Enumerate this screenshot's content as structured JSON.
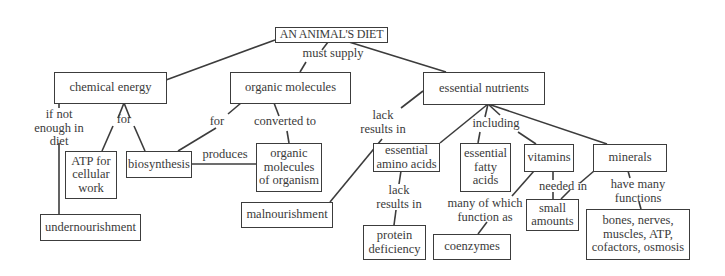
{
  "diagram": {
    "type": "concept-map",
    "title": "AN ANIMAL'S DIET",
    "nodes": {
      "root": "AN ANIMAL'S DIET",
      "chemical_energy": "chemical energy",
      "organic_molecules": "organic molecules",
      "essential_nutrients": "essential nutrients",
      "atp": "ATP for\ncellular\nwork",
      "biosynthesis": "biosynthesis",
      "organic_of_organism": "organic\nmolecules\nof organism",
      "undernourishment": "undernourishment",
      "malnourishment": "malnourishment",
      "amino_acids": "essential\namino acids",
      "fatty_acids": "essential\nfatty\nacids",
      "vitamins": "vitamins",
      "minerals": "minerals",
      "small_amounts": "small\namounts",
      "protein_deficiency": "protein\ndeficiency",
      "coenzymes": "coenzymes",
      "mineral_functions": "bones, nerves,\nmuscles, ATP,\ncofactors, osmosis"
    },
    "link_labels": {
      "must_supply": "must supply",
      "if_not_enough": "if not\nenough in\ndiet",
      "for_energy": "for",
      "for_organic": "for",
      "converted_to": "converted to",
      "produces": "produces",
      "lack_results_in": "lack\nresults in",
      "including": "including",
      "lack_results_in_aa": "lack\nresults in",
      "many_of_which": "many of which\nfunction as",
      "needed_in": "needed in",
      "have_many_functions": "have many\nfunctions"
    }
  }
}
